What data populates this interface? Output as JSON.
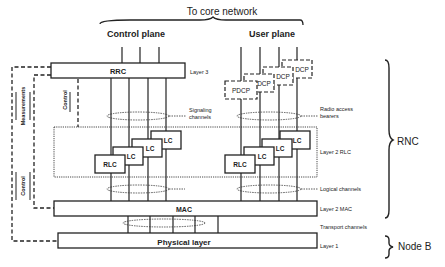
{
  "diagram": {
    "top_label": "To core network",
    "control_plane_label": "Control plane",
    "user_plane_label": "User plane",
    "blocks": {
      "rrc": "RRC",
      "pdcp": [
        "PDCP",
        "DCP",
        "DCP",
        "DCP"
      ],
      "rlc_control": [
        "RLC",
        "LC",
        "LC",
        "LC"
      ],
      "rlc_user": [
        "RLC",
        "LC",
        "LC",
        "LC"
      ],
      "mac": "MAC",
      "physical": "Physical layer"
    },
    "layer_labels": {
      "layer3": "Layer 3",
      "layer2_rlc": "Layer 2 RLC",
      "layer2_mac": "Layer 2 MAC",
      "layer1": "Layer 1"
    },
    "channel_labels": {
      "signaling": [
        "Signaling",
        "channels"
      ],
      "radio_access": [
        "Radio access",
        "bearers"
      ],
      "logical": "Logical channels",
      "transport": "Transport channels"
    },
    "side_labels": {
      "measurements": "Measurements",
      "control_left": "Control",
      "control_rrc": "Control"
    },
    "node_labels": {
      "rnc": "RNC",
      "node_b": "Node B"
    },
    "colors": {
      "line": "#222222",
      "box_fill": "#ffffff",
      "text": "#222222"
    }
  }
}
